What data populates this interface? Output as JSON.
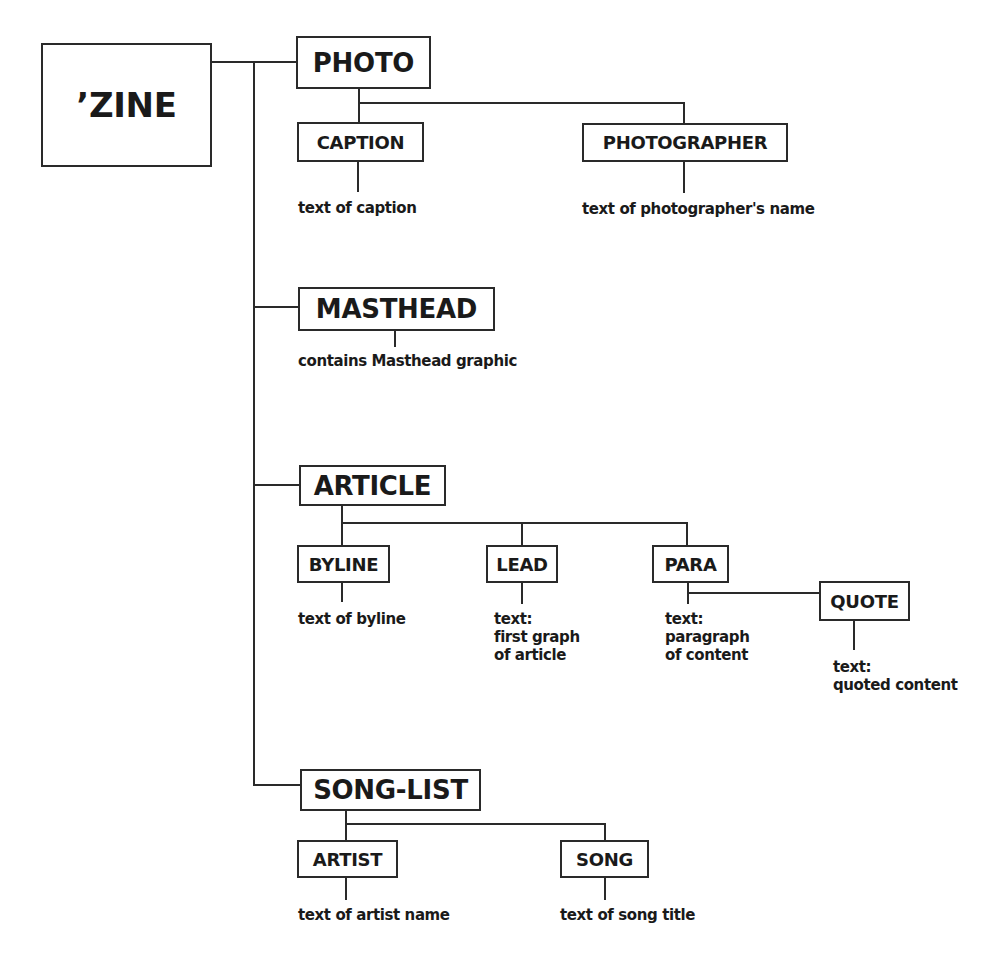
{
  "diagram": {
    "type": "tree",
    "root": {
      "label": "’ZINE",
      "children": [
        {
          "label": "PHOTO",
          "children": [
            {
              "label": "CAPTION",
              "description": [
                "text of caption"
              ]
            },
            {
              "label": "PHOTOGRAPHER",
              "description": [
                "text of photographer's name"
              ]
            }
          ]
        },
        {
          "label": "MASTHEAD",
          "description": [
            "contains Masthead graphic"
          ]
        },
        {
          "label": "ARTICLE",
          "children": [
            {
              "label": "BYLINE",
              "description": [
                "text of byline"
              ]
            },
            {
              "label": "LEAD",
              "description": [
                "text:",
                "first graph",
                "of article"
              ]
            },
            {
              "label": "PARA",
              "description": [
                "text:",
                "paragraph",
                "of content"
              ],
              "children": [
                {
                  "label": "QUOTE",
                  "description": [
                    "text:",
                    "quoted content"
                  ]
                }
              ]
            }
          ]
        },
        {
          "label": "SONG-LIST",
          "children": [
            {
              "label": "ARTIST",
              "description": [
                "text of artist name"
              ]
            },
            {
              "label": "SONG",
              "description": [
                "text of song title"
              ]
            }
          ]
        }
      ]
    }
  },
  "colors": {
    "line": "#2a2a2a",
    "text": "#1a1a1a",
    "background": "#ffffff"
  }
}
